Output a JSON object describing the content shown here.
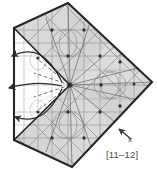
{
  "figure": {
    "title": "",
    "index_label": "[11–12]",
    "axis_label_x": "x",
    "colors": {
      "outline": "#2b2b2b",
      "fill_light": "#e3e3e3",
      "fill_mid": "#d2d2d2",
      "fill_dark": "#bfbfbf",
      "fill_white": "#ffffff",
      "lattice_line": "#8c8c8c",
      "lattice_line_dark": "#5f5f5f",
      "node": "#3a3a3a",
      "arrow": "#2e2e2e",
      "dashed": "#555555",
      "text": "#4a4a4a",
      "background": "#ffffff"
    },
    "shape": {
      "name": "diamond-kite-polygon",
      "vertices": [
        {
          "x": 68,
          "y": 3
        },
        {
          "x": 152,
          "y": 82
        },
        {
          "x": 72,
          "y": 167
        },
        {
          "x": 14,
          "y": 140
        },
        {
          "x": 14,
          "y": 28
        }
      ],
      "hub": {
        "x": 70,
        "y": 85
      }
    },
    "wedge": {
      "name": "white-fan-wedge",
      "apex": {
        "x": 70,
        "y": 85
      },
      "top": {
        "x": 14,
        "y": 28
      },
      "bottom": {
        "x": 14,
        "y": 140
      }
    },
    "arrows": [
      {
        "name": "curved-arrow-upper",
        "tip": {
          "x": 6,
          "y": 59
        }
      },
      {
        "name": "curved-arrow-middle",
        "tip": {
          "x": 3,
          "y": 89
        }
      },
      {
        "name": "curved-arrow-lower",
        "tip": {
          "x": 9,
          "y": 119
        }
      }
    ],
    "axis_arrow": {
      "name": "x-axis-arrow",
      "tip": {
        "x": 118,
        "y": 128
      },
      "tail": {
        "x": 132,
        "y": 140
      }
    },
    "lattice_nodes": [
      {
        "x": 68,
        "y": 3
      },
      {
        "x": 52,
        "y": 30
      },
      {
        "x": 84,
        "y": 30
      },
      {
        "x": 38,
        "y": 56
      },
      {
        "x": 68,
        "y": 56
      },
      {
        "x": 100,
        "y": 56
      },
      {
        "x": 14,
        "y": 28
      },
      {
        "x": 14,
        "y": 85
      },
      {
        "x": 14,
        "y": 140
      },
      {
        "x": 70,
        "y": 85
      },
      {
        "x": 101,
        "y": 85
      },
      {
        "x": 120,
        "y": 62
      },
      {
        "x": 120,
        "y": 106
      },
      {
        "x": 134,
        "y": 84
      },
      {
        "x": 100,
        "y": 112
      },
      {
        "x": 84,
        "y": 138
      },
      {
        "x": 52,
        "y": 138
      },
      {
        "x": 68,
        "y": 112
      },
      {
        "x": 38,
        "y": 112
      },
      {
        "x": 72,
        "y": 167
      }
    ]
  }
}
